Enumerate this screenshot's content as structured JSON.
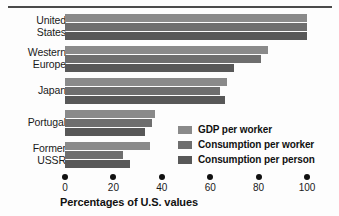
{
  "chart_data": {
    "type": "bar",
    "orientation": "horizontal",
    "title": "",
    "xlabel": "Percentages of U.S. values",
    "ylabel": "",
    "xlim": [
      0,
      100
    ],
    "xticks": [
      0,
      20,
      40,
      60,
      80,
      100
    ],
    "xticklabels": [
      "0",
      "20",
      "40",
      "60",
      "80",
      "100"
    ],
    "grid": false,
    "legend_position": "inside-bottom-right",
    "categories": [
      "United States",
      "Western Europe",
      "Japan",
      "Portugal",
      "Former USSR"
    ],
    "category_lines": [
      [
        "United",
        "States"
      ],
      [
        "Western",
        "Europe"
      ],
      [
        "Japan"
      ],
      [
        "Portugal"
      ],
      [
        "Former",
        "USSR"
      ]
    ],
    "series": [
      {
        "name": "GDP per worker",
        "color": "#8a8a8a",
        "values": [
          100,
          84,
          67,
          37,
          35
        ]
      },
      {
        "name": "Consumption per worker",
        "color": "#6e6e6e",
        "values": [
          100,
          81,
          64,
          36,
          24
        ]
      },
      {
        "name": "Consumption per person",
        "color": "#585858",
        "values": [
          100,
          70,
          66,
          33,
          27
        ]
      }
    ]
  },
  "axis": {
    "title": "Percentages of U.S. values"
  },
  "legend": {
    "items": [
      {
        "label": "GDP per worker",
        "color": "#8a8a8a"
      },
      {
        "label": "Consumption per worker",
        "color": "#6e6e6e"
      },
      {
        "label": "Consumption per person",
        "color": "#585858"
      }
    ]
  },
  "colors": {
    "series_light": "#8a8a8a",
    "series_medium": "#6e6e6e",
    "series_dark": "#585858",
    "rule": "#4a4a4a",
    "text": "#111111",
    "background": "#fdfdfd"
  }
}
